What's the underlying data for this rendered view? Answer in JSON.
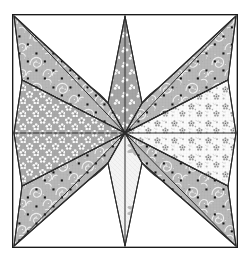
{
  "artwork": {
    "title": "Eight-Pointed Star Quilt Block",
    "description": "Patchwork quilt block diagram: an eight-pointed LeMoyne-style star with four diagonal corner points, four cardinal diamonds and four curved petal pieces, enclosed in a thin rectangular frame.",
    "canvas": {
      "width": 250,
      "height": 262
    },
    "center": {
      "x": 125,
      "y": 133
    }
  },
  "frame": {
    "name": "outer-border",
    "x": 12,
    "y": 14,
    "width": 226,
    "height": 234,
    "stroke": "#1a1a1a",
    "stroke_width": 1.2,
    "fill": "#ffffff"
  },
  "palette": {
    "outline": "#2b2b2b",
    "background": "#ffffff",
    "paisley_fill": "#b8b8b8",
    "paisley_motif": "#f2f2f2",
    "paisley_dot": "#121212",
    "trefoil_fill": "#a8a8a8",
    "trefoil_motif": "#fbfbfb",
    "daisy_fill": "#a9a9a9",
    "daisy_motif": "#fcfcfc",
    "sprig_fill": "#fbfbfb",
    "sprig_motif": "#9a9a9a",
    "pale_fill": "#f4f4f4",
    "pale_motif": "#b0b0b0",
    "petal_fill": "#cccccc",
    "petal_motif": "#fdfdfd"
  },
  "pieces": [
    {
      "id": "point-nw",
      "label": "Northwest corner point",
      "kind": "diagonal-point",
      "fabric": "paisley-with-dots",
      "fill": "#b8b8b8",
      "points": "14,16 108,103 125,133 22,80"
    },
    {
      "id": "point-ne",
      "label": "Northeast corner point",
      "kind": "diagonal-point",
      "fabric": "paisley-with-dots",
      "fill": "#b8b8b8",
      "points": "236,16 228,80 125,133 142,103"
    },
    {
      "id": "point-se",
      "label": "Southeast corner point",
      "kind": "diagonal-point",
      "fabric": "paisley-with-dots",
      "fill": "#b8b8b8",
      "points": "236,246 142,163 125,133 228,186"
    },
    {
      "id": "point-sw",
      "label": "Southwest corner point",
      "kind": "diagonal-point",
      "fabric": "paisley-with-dots",
      "fill": "#b8b8b8",
      "points": "14,246 22,186 125,133 108,163"
    },
    {
      "id": "diamond-north",
      "label": "North diamond",
      "kind": "cardinal-diamond",
      "fabric": "trefoil-on-gray",
      "fill": "#a8a8a8",
      "points": "125,16 142,103 125,133 108,103"
    },
    {
      "id": "diamond-east",
      "label": "East diamond",
      "kind": "cardinal-diamond",
      "fabric": "sprig-on-white",
      "fill": "#fbfbfb",
      "points": "236,133 228,186 125,133 228,80"
    },
    {
      "id": "diamond-south",
      "label": "South diamond",
      "kind": "cardinal-diamond",
      "fabric": "pale-floral",
      "fill": "#f4f4f4",
      "points": "125,246 108,163 125,133 142,163"
    },
    {
      "id": "diamond-west",
      "label": "West diamond",
      "kind": "cardinal-diamond",
      "fabric": "daisy-on-gray",
      "fill": "#a9a9a9",
      "points": "14,133 22,80 125,133 22,186"
    },
    {
      "id": "petal-nw",
      "label": "Northwest petal",
      "kind": "curved-petal",
      "fabric": "star-on-light-gray",
      "fill": "#cccccc",
      "path": "M 125,133 L 108,103 A 76,76 0 0 0 22,80 Z"
    },
    {
      "id": "petal-ne",
      "label": "Northeast petal",
      "kind": "curved-petal",
      "fabric": "star-on-light-gray",
      "fill": "#cccccc",
      "path": "M 125,133 L 228,80 A 76,76 0 0 0 142,103 Z"
    },
    {
      "id": "petal-se",
      "label": "Southeast petal",
      "kind": "curved-petal",
      "fabric": "star-on-light-gray",
      "fill": "#cccccc",
      "path": "M 125,133 L 142,163 A 76,76 0 0 0 228,186 Z"
    },
    {
      "id": "petal-sw",
      "label": "Southwest petal",
      "kind": "curved-petal",
      "fabric": "star-on-light-gray",
      "fill": "#cccccc",
      "path": "M 125,133 L 22,186 A 76,76 0 0 0 108,163 Z"
    }
  ],
  "seams": [
    {
      "id": "seam-center-n",
      "from": "125,133",
      "to": "125,16"
    },
    {
      "id": "seam-center-s",
      "from": "125,133",
      "to": "125,246"
    },
    {
      "id": "seam-center-w",
      "from": "125,133",
      "to": "14,133"
    },
    {
      "id": "seam-center-e",
      "from": "125,133",
      "to": "236,133"
    },
    {
      "id": "seam-center-nw",
      "from": "125,133",
      "to": "14,16"
    },
    {
      "id": "seam-center-ne",
      "from": "125,133",
      "to": "236,16"
    },
    {
      "id": "seam-center-sw",
      "from": "125,133",
      "to": "14,246"
    },
    {
      "id": "seam-center-se",
      "from": "125,133",
      "to": "236,246"
    }
  ]
}
